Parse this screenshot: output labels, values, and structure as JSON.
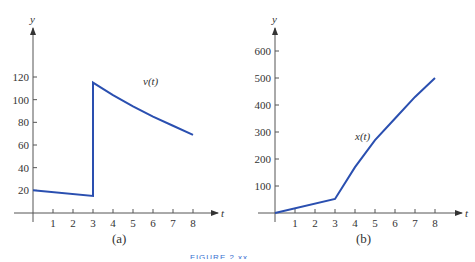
{
  "figure_caption": "FIGURE 2.xx",
  "chart_data": [
    {
      "type": "line",
      "panel_label": "(a)",
      "series": [
        {
          "name": "v(t)",
          "x": [
            0,
            3,
            3,
            4,
            5,
            6,
            7,
            8
          ],
          "values": [
            20,
            15,
            115,
            104,
            94,
            85,
            77,
            69
          ]
        }
      ],
      "annotation": "v(t)",
      "xlabel": "t",
      "ylabel": "y",
      "xticks": [
        "1",
        "2",
        "3",
        "4",
        "5",
        "6",
        "7",
        "8"
      ],
      "yticks": [
        "20",
        "40",
        "60",
        "80",
        "100",
        "120"
      ],
      "xlim": [
        0,
        8.5
      ],
      "ylim": [
        0,
        130
      ],
      "color": "#2a4fb0"
    },
    {
      "type": "line",
      "panel_label": "(b)",
      "series": [
        {
          "name": "x(t)",
          "x": [
            0,
            3,
            4,
            5,
            6,
            7,
            8
          ],
          "values": [
            0,
            52,
            170,
            270,
            350,
            430,
            500
          ]
        }
      ],
      "annotation": "x(t)",
      "xlabel": "t",
      "ylabel": "y",
      "xticks": [
        "1",
        "2",
        "3",
        "4",
        "5",
        "6",
        "7",
        "8"
      ],
      "yticks": [
        "100",
        "200",
        "300",
        "400",
        "500",
        "600"
      ],
      "xlim": [
        0,
        8.5
      ],
      "ylim": [
        0,
        650
      ],
      "color": "#2a4fb0"
    }
  ]
}
